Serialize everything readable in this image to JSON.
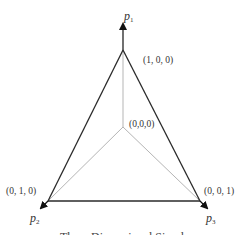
{
  "diagram": {
    "title": "Three Dimensional Simplex",
    "axes": [
      {
        "id": "p1",
        "name": "p",
        "subscript": "1"
      },
      {
        "id": "p2",
        "name": "p",
        "subscript": "2"
      },
      {
        "id": "p3",
        "name": "p",
        "subscript": "3"
      }
    ],
    "vertices": [
      {
        "id": "top",
        "label": "(1, 0, 0)"
      },
      {
        "id": "left",
        "label": "(0, 1, 0)"
      },
      {
        "id": "right",
        "label": "(0, 0, 1)"
      },
      {
        "id": "origin",
        "label": "(0,0,0)"
      }
    ],
    "colors": {
      "simplex_edge": "#2a2a2a",
      "axis_line": "#b0b0b0",
      "arrow": "#111111"
    }
  }
}
